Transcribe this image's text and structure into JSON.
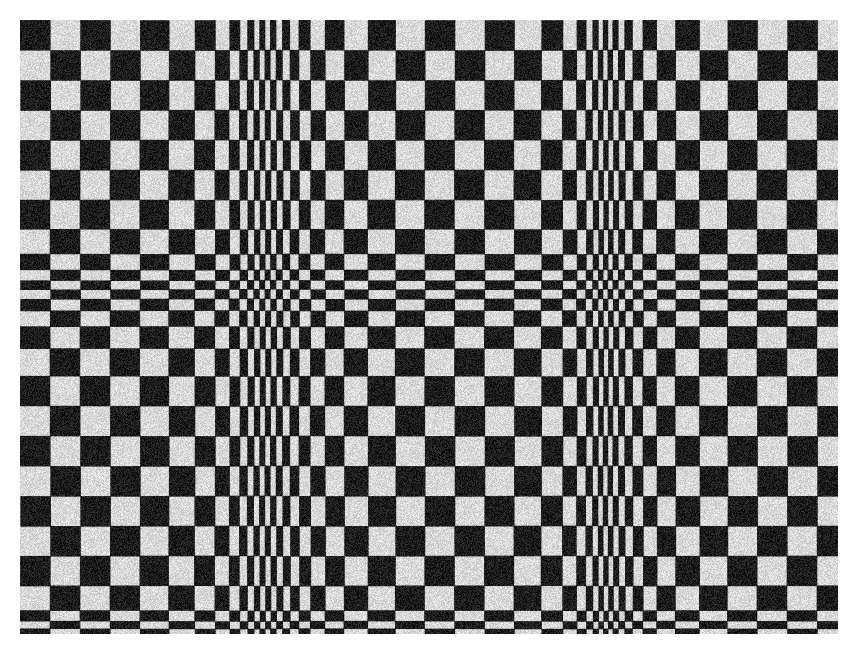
{
  "image": {
    "subject": "woven textile with distorted black-and-white checkerboard pattern",
    "width": 852,
    "height": 646,
    "background": "#ffffff",
    "fabric_rect": {
      "x": 20,
      "y": 20,
      "w": 818,
      "h": 614
    },
    "colors": {
      "dark": "#1c1c1c",
      "light": "#d9d9d9"
    },
    "base_cell": 30,
    "column_compressions": [
      {
        "center": 262,
        "width": 70,
        "strength": 0.82
      },
      {
        "center": 603,
        "width": 60,
        "strength": 0.84
      }
    ],
    "row_compressions": [
      {
        "center": 282,
        "width": 45,
        "strength": 0.7
      },
      {
        "center": 622,
        "width": 30,
        "strength": 0.75
      }
    ]
  }
}
